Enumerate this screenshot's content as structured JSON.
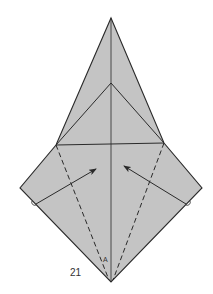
{
  "figure": {
    "step_number": "21",
    "point_label": "A",
    "colors": {
      "paper_fill": "#c4c4c4",
      "line": "#2a2a2a",
      "background": "#ffffff"
    },
    "elements": [
      {
        "type": "outline",
        "description": "kite-shaped folded paper with tall pointed top and wide lower wings"
      },
      {
        "type": "crease",
        "style": "solid",
        "description": "vertical center line from top apex to bottom point"
      },
      {
        "type": "crease",
        "style": "solid",
        "description": "inner triangle from inner apex down to both shoulders"
      },
      {
        "type": "crease",
        "style": "solid",
        "description": "horizontal line between shoulders"
      },
      {
        "type": "valley-fold",
        "style": "dashed",
        "description": "left diagonal from left shoulder to bottom point"
      },
      {
        "type": "valley-fold",
        "style": "dashed",
        "description": "right diagonal from right shoulder to bottom point"
      },
      {
        "type": "arrow",
        "direction": "up-right",
        "description": "fold left flap toward center"
      },
      {
        "type": "arrow",
        "direction": "up-left",
        "description": "fold right flap toward center"
      }
    ]
  }
}
